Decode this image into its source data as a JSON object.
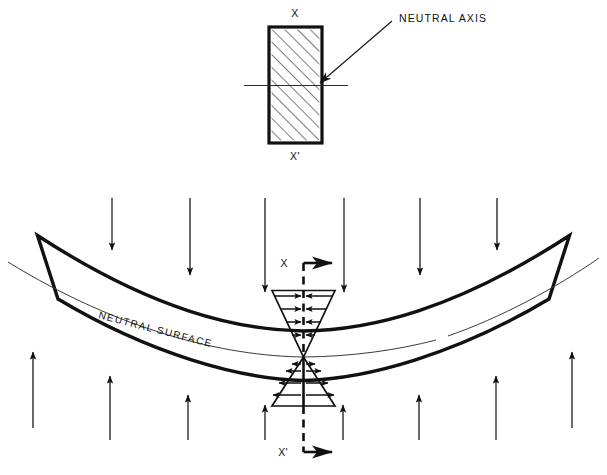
{
  "figure": {
    "background_color": "#ffffff",
    "line_color": "#111111",
    "thin_line_color": "#3a3a3a"
  },
  "cross_section": {
    "top_label": "X",
    "bottom_label": "X'",
    "hatch_style": "diagonal-45",
    "rect": {
      "x": 269,
      "y": 27,
      "width": 53,
      "height": 116
    }
  },
  "callout": {
    "label": "NEUTRAL AXIS",
    "arrow_from": {
      "x": 392,
      "y": 22
    },
    "arrow_to": {
      "x": 318,
      "y": 85
    }
  },
  "beam": {
    "neutral_surface_label": "NEUTRAL SURFACE",
    "section_marker_top_label": "X",
    "section_marker_bottom_label": "X'"
  },
  "loads": {
    "top_label": "downward distributed load",
    "top_arrow_count": 6,
    "bottom_label": "upward reaction",
    "bottom_arrow_count": 8
  },
  "stress_distribution": {
    "upper_region": {
      "name": "compression-above-neutral-axis",
      "arrow_direction": "right",
      "arrow_rows": 4
    },
    "lower_region": {
      "name": "tension-below-neutral-axis",
      "arrow_direction": "left",
      "arrow_rows": 4
    }
  }
}
